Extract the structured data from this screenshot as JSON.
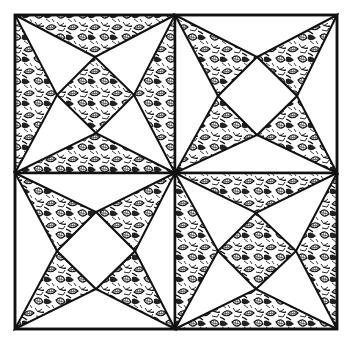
{
  "illustration": {
    "title": "Quilt block pattern illustration",
    "subject": "four-patch star quilt block with leaf-textured fabric",
    "colors": {
      "background": "#ffffff",
      "line": "#111111",
      "texture_dark": "#1a1a1a",
      "texture_light": "#ffffff"
    },
    "bounds": {
      "x1": 15,
      "y1": 15,
      "x2": 337,
      "y2": 329,
      "center_x": 175,
      "center_y": 173
    },
    "quadrants": [
      {
        "name": "top-left",
        "style": "textured-diamond-with-edge-triangles"
      },
      {
        "name": "top-right",
        "style": "white-diamond-with-textured-star-points"
      },
      {
        "name": "bottom-left",
        "style": "white-diamond-with-textured-star-points"
      },
      {
        "name": "bottom-right",
        "style": "textured-diamond-with-edge-triangles"
      }
    ]
  }
}
